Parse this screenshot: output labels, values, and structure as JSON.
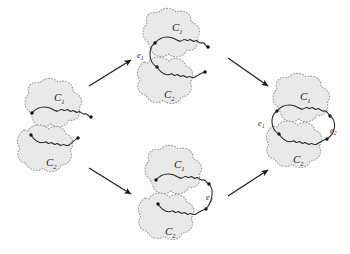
{
  "figure": {
    "type": "commutative-diagram",
    "background_color": "#fdfdfc",
    "blob_fill": "#e9e9e9",
    "blob_border_color": "#9a9a9a",
    "curve_color": "#2a2a2a",
    "node_color": "#111111",
    "arrow_color": "#1a1a1a"
  },
  "panels": [
    {
      "id": "left",
      "name": "panel-disjoint",
      "labels": {
        "c1": "C",
        "c1_sub": "1",
        "c2": "C",
        "c2_sub": "2"
      },
      "edges": []
    },
    {
      "id": "top-middle",
      "name": "panel-merged-e1",
      "labels": {
        "c1": "C",
        "c1_sub": "1",
        "c2": "C",
        "c2_sub": "2"
      },
      "edges": [
        {
          "label": "e",
          "sub": "1",
          "side": "left"
        }
      ]
    },
    {
      "id": "bottom-middle",
      "name": "panel-merged-e2",
      "labels": {
        "c1": "C",
        "c1_sub": "1",
        "c2": "C",
        "c2_sub": "2"
      },
      "edges": [
        {
          "label": "e",
          "sub": "2",
          "side": "right"
        }
      ]
    },
    {
      "id": "right",
      "name": "panel-merged-e1-e2",
      "labels": {
        "c1": "C",
        "c1_sub": "1",
        "c2": "C",
        "c2_sub": "2"
      },
      "edges": [
        {
          "label": "e",
          "sub": "1",
          "side": "left"
        },
        {
          "label": "e",
          "sub": "2",
          "side": "right"
        }
      ]
    }
  ],
  "arrows": [
    {
      "name": "arrow-left-to-top",
      "from": "left",
      "to": "top-middle"
    },
    {
      "name": "arrow-left-to-bottom",
      "from": "left",
      "to": "bottom-middle"
    },
    {
      "name": "arrow-top-to-right",
      "from": "top-middle",
      "to": "right"
    },
    {
      "name": "arrow-bottom-to-right",
      "from": "bottom-middle",
      "to": "right"
    }
  ],
  "bleed_text": {
    "line1": " ",
    "line2": " "
  }
}
